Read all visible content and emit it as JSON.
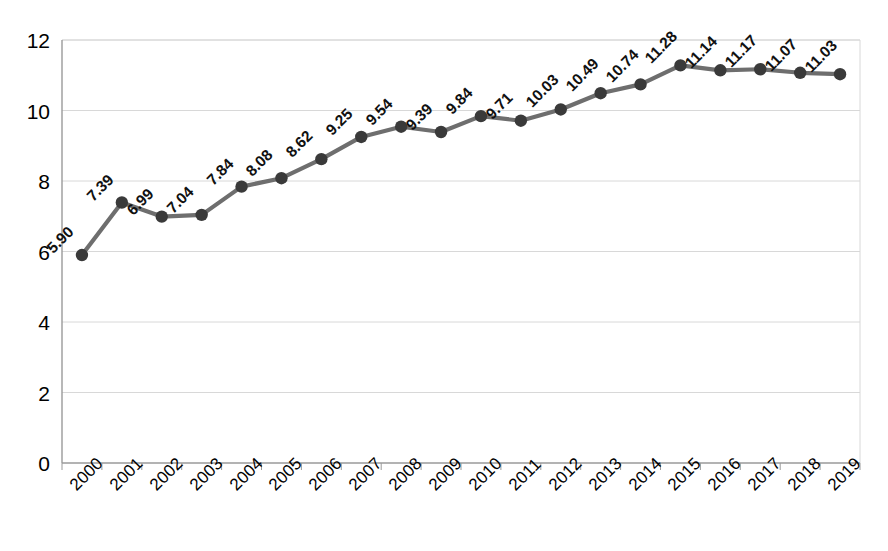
{
  "chart_data": {
    "type": "line",
    "title": "",
    "subtitle": "",
    "xlabel": "",
    "ylabel": "",
    "categories": [
      "2000",
      "2001",
      "2002",
      "2003",
      "2004",
      "2005",
      "2006",
      "2007",
      "2008",
      "2009",
      "2010",
      "2011",
      "2012",
      "2013",
      "2014",
      "2015",
      "2016",
      "2017",
      "2018",
      "2019"
    ],
    "values": [
      5.9,
      7.39,
      6.99,
      7.04,
      7.84,
      8.08,
      8.62,
      9.25,
      9.54,
      9.39,
      9.84,
      9.71,
      10.03,
      10.49,
      10.74,
      11.28,
      11.14,
      11.17,
      11.07,
      11.03
    ],
    "point_labels": [
      "5.90",
      "7.39",
      "6.99",
      "7.04",
      "7.84",
      "8.08",
      "8.62",
      "9.25",
      "9.54",
      "9.39",
      "9.84",
      "9.71",
      "10.03",
      "10.49",
      "10.74",
      "11.28",
      "11.14",
      "11.17",
      "11.07",
      "11.03"
    ],
    "series": [
      {
        "name": "",
        "values": [
          5.9,
          7.39,
          6.99,
          7.04,
          7.84,
          8.08,
          8.62,
          9.25,
          9.54,
          9.39,
          9.84,
          9.71,
          10.03,
          10.49,
          10.74,
          11.28,
          11.14,
          11.17,
          11.07,
          11.03
        ]
      }
    ],
    "ylim": [
      0,
      12
    ],
    "yticks": [
      0,
      2,
      4,
      6,
      8,
      10,
      12
    ],
    "ytick_labels": [
      "0",
      "2",
      "4",
      "6",
      "8",
      "10",
      "12"
    ],
    "grid": true,
    "grid_axis": "y",
    "legend": false,
    "legend_position": "none",
    "data_labels_shown": true,
    "data_label_rotation_deg": 45,
    "xtick_label_rotation_deg": 45,
    "colors": {
      "line": "#6e6e6e",
      "marker": "#3a3a3a",
      "gridline": "#d8d8d8",
      "axis": "#9a9a9a",
      "text": "#000000",
      "background": "#ffffff"
    }
  }
}
